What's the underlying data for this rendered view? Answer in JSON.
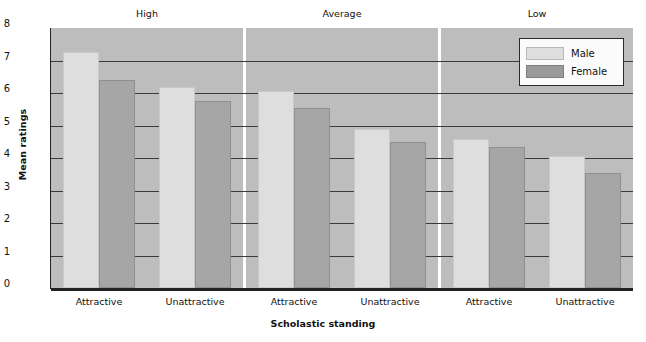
{
  "chart_data": {
    "type": "bar",
    "title": "",
    "xlabel": "Scholastic standing",
    "ylabel": "Mean ratings",
    "ylim": [
      0,
      8
    ],
    "yticks": [
      0,
      1,
      2,
      3,
      4,
      5,
      6,
      7,
      8
    ],
    "grid": true,
    "legend_position": "top-right",
    "panels": [
      {
        "title": "High",
        "categories": [
          "Attractive",
          "Unattractive"
        ],
        "series": [
          {
            "name": "Male",
            "values": [
              7.25,
              6.2
            ]
          },
          {
            "name": "Female",
            "values": [
              6.4,
              5.75
            ]
          }
        ]
      },
      {
        "title": "Average",
        "categories": [
          "Attractive",
          "Unattractive"
        ],
        "series": [
          {
            "name": "Male",
            "values": [
              6.05,
              4.9
            ]
          },
          {
            "name": "Female",
            "values": [
              5.55,
              4.5
            ]
          }
        ]
      },
      {
        "title": "Low",
        "categories": [
          "Attractive",
          "Unattractive"
        ],
        "series": [
          {
            "name": "Male",
            "values": [
              4.6,
              4.05
            ]
          },
          {
            "name": "Female",
            "values": [
              4.35,
              3.55
            ]
          }
        ]
      }
    ],
    "legend": [
      {
        "label": "Male",
        "color": "#dedede"
      },
      {
        "label": "Female",
        "color": "#a6a6a6"
      }
    ],
    "colors": {
      "male": "#dedede",
      "female": "#a6a6a6",
      "panel_background": "#bdbdbd",
      "gridline": "#3a3a3a",
      "axis": "#222222"
    }
  }
}
